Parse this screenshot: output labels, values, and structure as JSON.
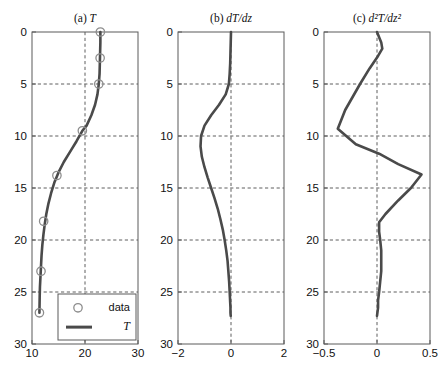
{
  "figure": {
    "background": "#ffffff",
    "curve_color": "#4a4a4a",
    "marker_color": "#8d8d8d",
    "grid_color": "#4d4d4d",
    "axis_color": "#5a5a5a"
  },
  "shared_axis": {
    "ylabel": "",
    "ylim": [
      0,
      30
    ],
    "yticks": [
      0,
      5,
      10,
      15,
      20,
      25,
      30
    ],
    "yticklabels": [
      "0",
      "5",
      "10",
      "15",
      "20",
      "25",
      "30"
    ],
    "y_inverted": true,
    "grid": true
  },
  "legend": {
    "position": "lower-center-panel-a",
    "entries": [
      {
        "label": "data",
        "marker": "circle",
        "style": "marker"
      },
      {
        "label": "T",
        "marker": "line",
        "style": "line",
        "italic": true
      }
    ]
  },
  "chart_data": [
    {
      "type": "line",
      "panel": "a",
      "title": "(a) T",
      "title_prefix": "(a)",
      "title_symbol": "T",
      "xlabel": "",
      "ylabel": "",
      "xlim": [
        10,
        30
      ],
      "ylim": [
        0,
        30
      ],
      "xticks": [
        10,
        20,
        30
      ],
      "xticklabels": [
        "10",
        "20",
        "30"
      ],
      "yticks": [
        0,
        5,
        10,
        15,
        20,
        25,
        30
      ],
      "grid": true,
      "series": [
        {
          "name": "T",
          "style": "line",
          "x": [
            22.9,
            22.9,
            22.85,
            22.8,
            22.75,
            22.6,
            22.35,
            21.9,
            21.2,
            20.3,
            19.5,
            18.4,
            17.2,
            16.0,
            15.0,
            14.2,
            13.6,
            13.1,
            12.7,
            12.4,
            12.15,
            11.95,
            11.8,
            11.7,
            11.6,
            11.5,
            11.45,
            11.4
          ],
          "z": [
            0,
            1,
            2,
            3,
            4,
            5,
            6,
            7,
            8,
            9,
            9.5,
            10.5,
            11.5,
            12.5,
            13.5,
            14.5,
            15.5,
            16.5,
            17.5,
            18.5,
            19.5,
            20.5,
            21.5,
            22.5,
            23.5,
            24.5,
            25.5,
            27
          ]
        },
        {
          "name": "data",
          "style": "marker",
          "x": [
            22.9,
            22.85,
            22.6,
            19.5,
            14.7,
            12.2,
            11.7,
            11.4
          ],
          "z": [
            0,
            2.5,
            5.0,
            9.5,
            13.8,
            18.2,
            23.0,
            27.0
          ]
        }
      ]
    },
    {
      "type": "line",
      "panel": "b",
      "title": "(b) dT/dz",
      "title_prefix": "(b)",
      "title_symbol": "dT/dz",
      "xlabel": "",
      "ylabel": "",
      "xlim": [
        -2,
        2
      ],
      "ylim": [
        0,
        30
      ],
      "xticks": [
        -2,
        0,
        2
      ],
      "xticklabels": [
        "−2",
        "0",
        "2"
      ],
      "yticks": [
        0,
        5,
        10,
        15,
        20,
        25,
        30
      ],
      "grid": true,
      "series": [
        {
          "name": "dT/dz",
          "style": "line",
          "x": [
            0.0,
            -0.01,
            -0.02,
            -0.03,
            -0.05,
            -0.08,
            -0.2,
            -0.45,
            -0.75,
            -1.0,
            -1.13,
            -1.15,
            -1.1,
            -1.0,
            -0.88,
            -0.75,
            -0.62,
            -0.5,
            -0.4,
            -0.31,
            -0.24,
            -0.18,
            -0.13,
            -0.1,
            -0.07,
            -0.05,
            -0.04,
            -0.03,
            -0.02,
            -0.02,
            -0.01
          ],
          "z": [
            0,
            1,
            2,
            3,
            4,
            5,
            6,
            7,
            8,
            9,
            10,
            11,
            12,
            13,
            14,
            15,
            16,
            17,
            18,
            19,
            20,
            21,
            22,
            23,
            24,
            25,
            25.5,
            26,
            26.5,
            27,
            27.3
          ]
        }
      ]
    },
    {
      "type": "line",
      "panel": "c",
      "title": "(c) d2T/dz2",
      "title_prefix": "(c)",
      "title_symbol": "d²T/dz²",
      "xlabel": "",
      "ylabel": "",
      "xlim": [
        -0.5,
        0.5
      ],
      "ylim": [
        0,
        30
      ],
      "xticks": [
        -0.5,
        0,
        0.5
      ],
      "xticklabels": [
        "−0.5",
        "0",
        "0.5"
      ],
      "yticks": [
        0,
        5,
        10,
        15,
        20,
        25,
        30
      ],
      "grid": true,
      "series": [
        {
          "name": "d2T/dz2",
          "style": "line",
          "x": [
            0.0,
            0.04,
            0.05,
            0.01,
            -0.07,
            -0.16,
            -0.3,
            -0.37,
            -0.2,
            0.02,
            0.2,
            0.42,
            0.32,
            0.2,
            0.08,
            0.02,
            0.02,
            0.03,
            0.04,
            0.04,
            0.04,
            0.03,
            0.02,
            0.01,
            0.01,
            0.0
          ],
          "z": [
            0,
            1.0,
            1.6,
            2.3,
            3.5,
            5.0,
            7.5,
            9.3,
            10.8,
            11.7,
            12.7,
            13.7,
            15.0,
            16.2,
            17.5,
            18.3,
            19.2,
            20.0,
            21.0,
            22.0,
            23.0,
            24.0,
            25.0,
            25.8,
            26.5,
            27.3
          ]
        }
      ]
    }
  ]
}
